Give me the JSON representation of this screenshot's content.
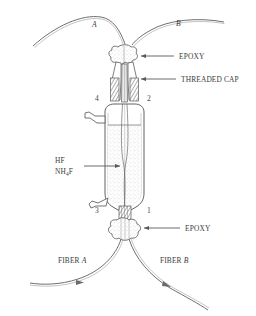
{
  "figure": {
    "type": "apparatus-diagram",
    "background_color": "#ffffff",
    "ink_color": "#555555",
    "labels": {
      "fiber_a_top": "A",
      "fiber_b_top": "B",
      "epoxy_top": "EPOXY",
      "threaded_cap": "THREADED CAP",
      "etchant_line1": "HF",
      "etchant_line2_pre": "NH",
      "etchant_line2_sub": "4",
      "etchant_line2_post": "F",
      "epoxy_bottom": "EPOXY",
      "fiber_a_bottom_pre": "FIBER ",
      "fiber_a_bottom_it": "A",
      "fiber_b_bottom_pre": "FIBER ",
      "fiber_b_bottom_it": "B",
      "port_1": "1",
      "port_2": "2",
      "port_3": "3",
      "port_4": "4"
    }
  }
}
